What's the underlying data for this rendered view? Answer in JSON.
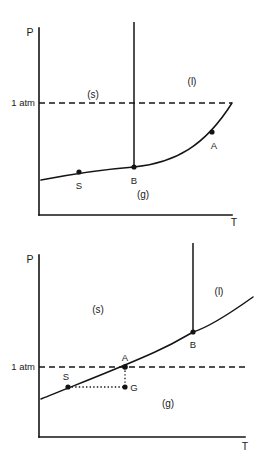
{
  "figure": {
    "background_color": "#ffffff",
    "ink_color": "#141414"
  },
  "diagrams": [
    {
      "id": "top",
      "name": "co2-like-phase-diagram",
      "description": "Sublimation-type P-T diagram where the 1 atm line lies below the triple point",
      "axes": {
        "y_label": "P",
        "x_label": "T",
        "origin": {
          "x": 39,
          "y": 215
        },
        "y_top": {
          "x": 39,
          "y": 28
        },
        "x_right": {
          "x": 232,
          "y": 215
        }
      },
      "pressure_reference": {
        "label": "1 atm",
        "y": 103,
        "line_start_x": 39,
        "line_end_x": 232,
        "style": "dashed"
      },
      "phase_labels": [
        {
          "text": "(s)",
          "x": 93,
          "y": 95
        },
        {
          "text": "(l)",
          "x": 192,
          "y": 82
        },
        {
          "text": "(g)",
          "x": 143,
          "y": 195
        }
      ],
      "boundary_curve": {
        "name": "sublimation-vaporization-curve",
        "path": "M 41 180 C 62 176 95 170 134 167 C 175 163 205 146 232 103"
      },
      "vertical_line": {
        "name": "fusion-line",
        "x": 134,
        "y_bottom": 167,
        "y_top": 22
      },
      "points": [
        {
          "label": "S",
          "x": 79,
          "y": 172,
          "label_x": 79,
          "label_y": 186
        },
        {
          "label": "B",
          "x": 134,
          "y": 167,
          "label_x": 134,
          "label_y": 181
        },
        {
          "label": "A",
          "x": 212,
          "y": 132,
          "label_x": 214,
          "label_y": 147
        }
      ]
    },
    {
      "id": "bottom",
      "name": "water-like-phase-diagram",
      "description": "Melting-type P-T diagram where the 1 atm line crosses the solid-liquid region",
      "axes": {
        "y_label": "P",
        "x_label": "T",
        "origin": {
          "x": 39,
          "y": 437
        },
        "y_top": {
          "x": 39,
          "y": 255
        },
        "x_right": {
          "x": 245,
          "y": 437
        }
      },
      "pressure_reference": {
        "label": "1 atm",
        "y": 367,
        "line_start_x": 39,
        "line_end_x": 245,
        "style": "dashed"
      },
      "phase_labels": [
        {
          "text": "(s)",
          "x": 98,
          "y": 310
        },
        {
          "text": "(l)",
          "x": 219,
          "y": 292
        },
        {
          "text": "(g)",
          "x": 168,
          "y": 404
        }
      ],
      "boundary_curve": {
        "name": "sublimation-fusion-vaporization-curve",
        "path": "M 41 399 C 70 387 120 368 155 352 C 175 343 186 336 193 332 C 210 327 232 312 253 297"
      },
      "vertical_line": {
        "name": "fusion-line",
        "x": 193,
        "y_bottom": 332,
        "y_top": 243
      },
      "guides": [
        {
          "name": "s-to-g-horizontal-guide",
          "style": "dotted",
          "x1": 68,
          "y1": 387,
          "x2": 125,
          "y2": 387
        },
        {
          "name": "a-to-g-vertical-guide",
          "style": "dotted",
          "x1": 125,
          "y1": 367,
          "x2": 125,
          "y2": 387
        }
      ],
      "points": [
        {
          "label": "S",
          "x": 68,
          "y": 387,
          "label_x": 66,
          "label_y": 377
        },
        {
          "label": "A",
          "x": 125,
          "y": 367,
          "label_x": 125,
          "label_y": 358
        },
        {
          "label": "G",
          "x": 125,
          "y": 387,
          "label_x": 134,
          "label_y": 391
        },
        {
          "label": "B",
          "x": 193,
          "y": 332,
          "label_x": 193,
          "label_y": 345
        }
      ]
    }
  ]
}
